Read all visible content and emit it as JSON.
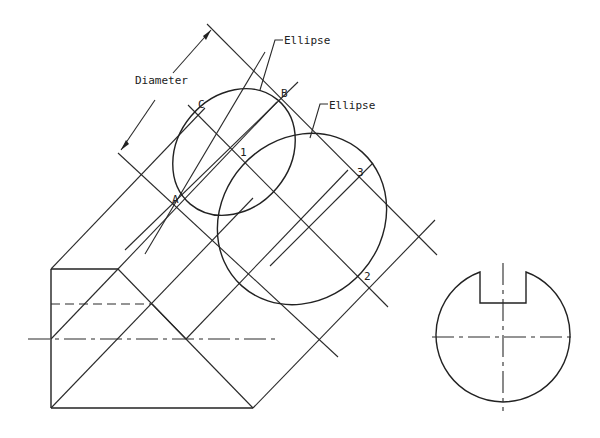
{
  "figure": {
    "type": "technical drawing"
  },
  "labels": {
    "diameter": "Diameter",
    "ellipse_1": "Ellipse",
    "ellipse_2": "Ellipse",
    "point_a": "A",
    "point_b": "B",
    "point_c": "C",
    "point_1": "1",
    "point_2": "2",
    "point_3": "3"
  },
  "colors": {
    "line": "#2a2a2a",
    "background": "#ffffff"
  }
}
